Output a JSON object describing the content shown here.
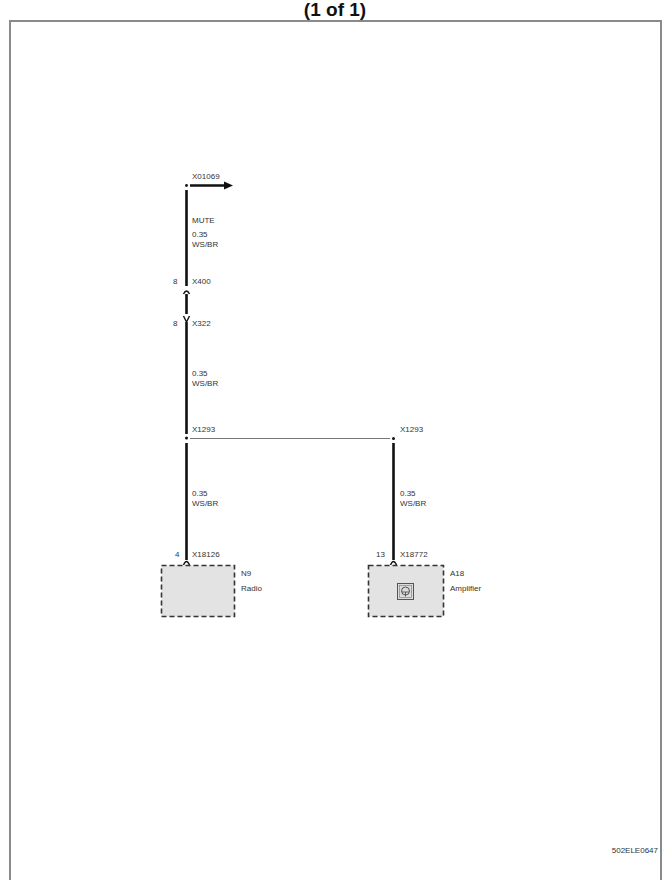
{
  "header": {
    "title": "(1 of 1)"
  },
  "footer": {
    "document_id": "502ELE0647"
  },
  "colors": {
    "wire": "#111111",
    "splice_line": "#777777",
    "component_fill": "#e3e3e3",
    "component_border": "#333333",
    "frame": "#8a8a8a",
    "text": "#333333"
  },
  "diagram": {
    "continuation": {
      "connector": "X01069",
      "direction": "right-arrow-icon"
    },
    "wires": [
      {
        "segment": "top",
        "signal": "MUTE",
        "gauge": "0.35",
        "color_code": "WS/BR"
      },
      {
        "segment": "middle",
        "gauge": "0.35",
        "color_code": "WS/BR"
      },
      {
        "segment": "radio-branch",
        "gauge": "0.35",
        "color_code": "WS/BR"
      },
      {
        "segment": "amplifier-branch",
        "gauge": "0.35",
        "color_code": "WS/BR"
      }
    ],
    "inline_connectors": [
      {
        "pin": "8",
        "name": "X400"
      },
      {
        "pin": "8",
        "name": "X322"
      }
    ],
    "splices": [
      {
        "name": "X1293",
        "side": "left"
      },
      {
        "name": "X1293",
        "side": "right"
      }
    ],
    "components": [
      {
        "pin": "4",
        "connector": "X18126",
        "id": "N9",
        "name": "Radio"
      },
      {
        "pin": "13",
        "connector": "X18772",
        "id": "A18",
        "name": "Amplifier",
        "icon": "speaker-module-icon"
      }
    ]
  }
}
